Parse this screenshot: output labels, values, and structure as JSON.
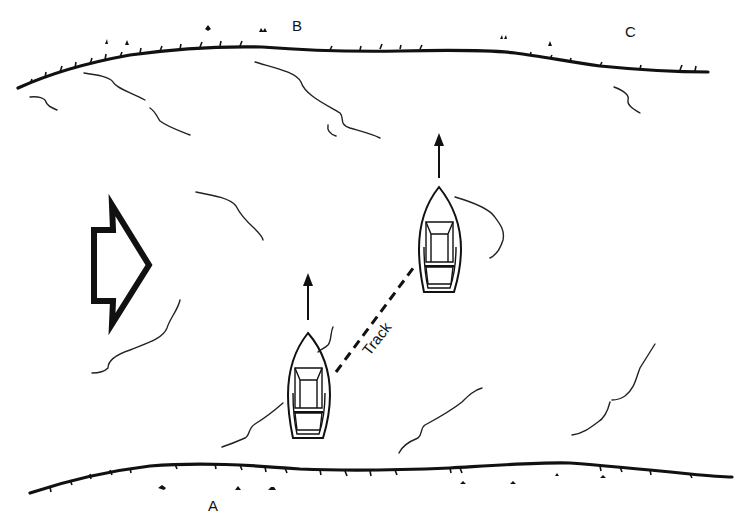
{
  "figure": {
    "labels": {
      "point_a": "A",
      "point_b": "B",
      "point_c": "C",
      "track": "Track"
    },
    "elements": {
      "current_arrow": "hollow-arrow-pointing-right",
      "boats": [
        {
          "name": "boat-start",
          "heading": "north"
        },
        {
          "name": "boat-drifted",
          "heading": "north"
        }
      ],
      "heading_arrows": 2,
      "shores": [
        "north-shore",
        "south-shore"
      ]
    },
    "caption": "Fig. ... (caption cut off at bottom edge)"
  }
}
